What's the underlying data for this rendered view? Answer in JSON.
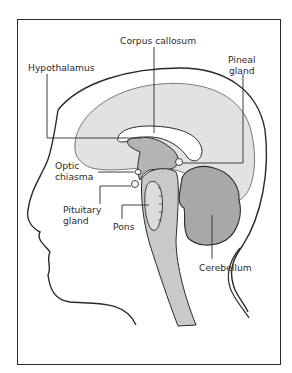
{
  "diagram": {
    "type": "anatomical-cross-section",
    "labels": {
      "corpus_callosum": "Corpus callosum",
      "hypothalamus": "Hypothalamus",
      "pineal_gland_line1": "Pineal",
      "pineal_gland_line2": "gland",
      "optic_chiasma_line1": "Optic",
      "optic_chiasma_line2": "chiasma",
      "pituitary_gland_line1": "Pituitary",
      "pituitary_gland_line2": "gland",
      "pons": "Pons",
      "cerebellum": "Cerebellum"
    },
    "colors": {
      "cerebrum_fill": "#e2e2e2",
      "brainstem_fill": "#c9c9c9",
      "diencephalon_fill": "#b4b4b4",
      "cerebellum_fill": "#a8a8a8",
      "outline": "#2a2a2a",
      "background": "#ffffff"
    }
  }
}
